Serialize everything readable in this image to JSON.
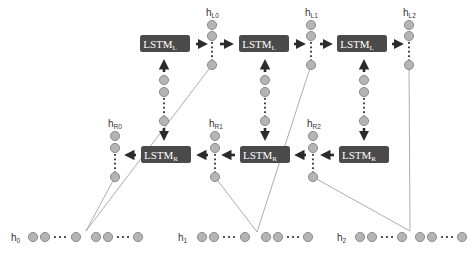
{
  "diagram": {
    "type": "bidirectional-lstm",
    "colors": {
      "box": "#4a4a4a",
      "box_text": "#ffffff",
      "node_fill": "#b4b4b4",
      "node_stroke": "#7a7a7a",
      "arrow": "#2b2b2b",
      "line": "#8a8a8a",
      "label": "#333333"
    },
    "lstm_left": [
      {
        "label": "LSTM",
        "sub": "L"
      },
      {
        "label": "LSTM",
        "sub": "L"
      },
      {
        "label": "LSTM",
        "sub": "L"
      }
    ],
    "lstm_right": [
      {
        "label": "LSTM",
        "sub": "R"
      },
      {
        "label": "LSTM",
        "sub": "R"
      },
      {
        "label": "LSTM",
        "sub": "R"
      }
    ],
    "hidden_left": [
      {
        "label": "h",
        "sub": "L0"
      },
      {
        "label": "h",
        "sub": "L1"
      },
      {
        "label": "h",
        "sub": "L2"
      }
    ],
    "hidden_right": [
      {
        "label": "h",
        "sub": "R0"
      },
      {
        "label": "h",
        "sub": "R1"
      },
      {
        "label": "h",
        "sub": "R2"
      }
    ],
    "inputs": [
      {
        "label": "h",
        "sub": "0"
      },
      {
        "label": "h",
        "sub": "1"
      },
      {
        "label": "h",
        "sub": "2"
      }
    ]
  }
}
